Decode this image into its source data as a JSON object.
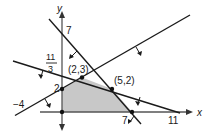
{
  "diagram": {
    "type": "linear-programming-feasible-region",
    "axes": {
      "x_label": "x",
      "y_label": "y"
    },
    "constraints": [
      {
        "line": "x + y = 7",
        "x_intercept": "7",
        "y_intercept": "7"
      },
      {
        "line": "x + 3y = 11",
        "x_intercept": "11",
        "y_intercept_num": "11",
        "y_intercept_den": "3"
      },
      {
        "line": "x - 2y = -4",
        "x_intercept": "-4",
        "y_intercept": "2"
      }
    ],
    "vertices": [
      {
        "label": "(2,3)"
      },
      {
        "label": "(5,2)"
      }
    ],
    "tick_labels": {
      "y_seven": "7",
      "y_frac_num": "11",
      "y_frac_den": "3",
      "y_two": "2",
      "x_neg_four": "−4",
      "x_seven": "7",
      "x_eleven": "11"
    },
    "colors": {
      "region": "#c8c8c8",
      "line": "#1a1a1a",
      "axis": "#555555"
    }
  }
}
